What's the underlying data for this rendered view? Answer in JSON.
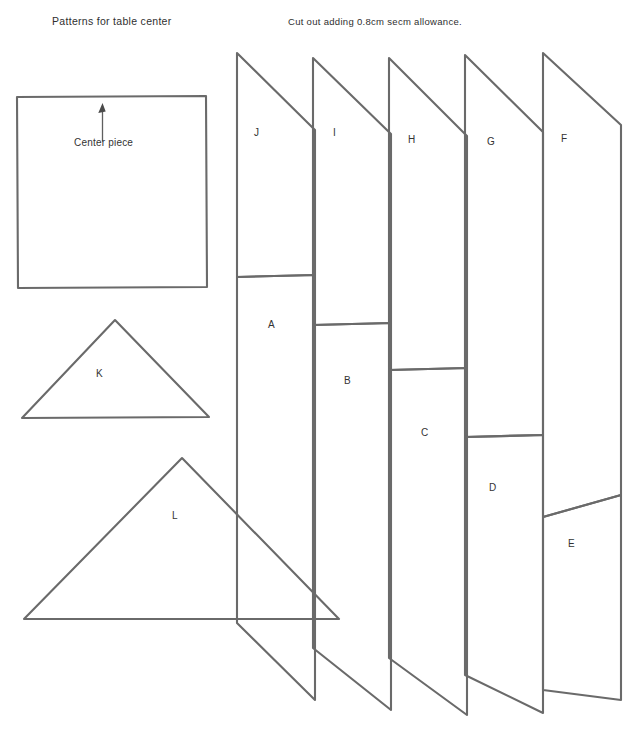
{
  "document": {
    "title": "Patterns for table center",
    "note": "Cut out adding 0.8cm secm allowance.",
    "ink_color": "#6a6a6a",
    "background_color": "#ffffff"
  },
  "center_piece": {
    "label": "Center piece",
    "grainline_icon": "up-arrow-icon",
    "shape": "square",
    "x": 17,
    "y": 96,
    "width": 190,
    "height": 192
  },
  "triangles": [
    {
      "label": "K",
      "shape": "triangle",
      "apex_x": 115,
      "apex_y": 320,
      "base_left_x": 22,
      "base_left_y": 418,
      "base_right_x": 209,
      "base_right_y": 417,
      "label_x": 96,
      "label_y": 368
    },
    {
      "label": "L",
      "shape": "triangle",
      "apex_x": 182,
      "apex_y": 458,
      "base_left_x": 24,
      "base_left_y": 619,
      "base_right_x": 339,
      "base_right_y": 619,
      "label_x": 172,
      "label_y": 510
    }
  ],
  "strips": [
    {
      "upper_label": "J",
      "lower_label": "A",
      "left_x": 237,
      "right_x": 315,
      "top_y": 53,
      "diag1_right_y": 130,
      "diag2_right_y": 275,
      "diag2_left_y": 277,
      "bottom_y": 623,
      "diag3_right_y": 700,
      "upper_label_x": 254,
      "upper_label_y": 127,
      "lower_label_x": 268,
      "lower_label_y": 319
    },
    {
      "upper_label": "I",
      "lower_label": "B",
      "left_x": 313,
      "right_x": 391,
      "top_y": 58,
      "diag1_right_y": 134,
      "diag2_right_y": 323,
      "diag2_left_y": 325,
      "bottom_y": 648,
      "diag3_right_y": 710,
      "upper_label_x": 333,
      "upper_label_y": 127,
      "lower_label_x": 344,
      "lower_label_y": 375
    },
    {
      "upper_label": "H",
      "lower_label": "C",
      "left_x": 389,
      "right_x": 467,
      "top_y": 58,
      "diag1_right_y": 136,
      "diag2_right_y": 368,
      "diag2_left_y": 370,
      "bottom_y": 658,
      "diag3_right_y": 715,
      "upper_label_x": 408,
      "upper_label_y": 134,
      "lower_label_x": 421,
      "lower_label_y": 427
    },
    {
      "upper_label": "G",
      "lower_label": "D",
      "left_x": 465,
      "right_x": 543,
      "top_y": 55,
      "diag1_right_y": 132,
      "diag2_right_y": 435,
      "diag2_left_y": 437,
      "bottom_y": 675,
      "diag3_right_y": 713,
      "upper_label_x": 487,
      "upper_label_y": 136,
      "lower_label_x": 489,
      "lower_label_y": 482
    },
    {
      "upper_label": "F",
      "lower_label": "E",
      "left_x": 543,
      "right_x": 621,
      "top_y": 53,
      "diag1_right_y": 125,
      "diag2_right_y": 495,
      "diag2_left_y": 517,
      "bottom_y": 690,
      "diag3_right_y": 700,
      "upper_label_x": 561,
      "upper_label_y": 133,
      "lower_label_x": 568,
      "lower_label_y": 538
    }
  ]
}
